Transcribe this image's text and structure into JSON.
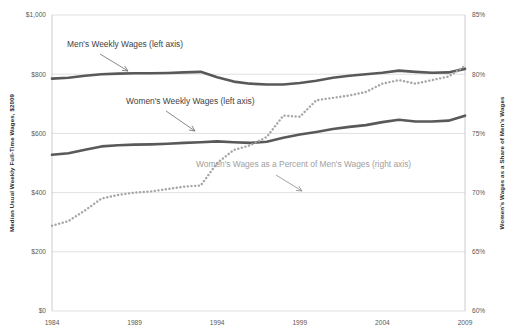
{
  "chart_data": {
    "type": "line",
    "title": "",
    "xlabel": "",
    "ylabel": "Median Usual Weekly Full-Time Wages, $2009",
    "y2label": "Women's Wages as a Share of Men's Wages",
    "x": [
      1984,
      1985,
      1986,
      1987,
      1988,
      1989,
      1990,
      1991,
      1992,
      1993,
      1994,
      1995,
      1996,
      1997,
      1998,
      1999,
      2000,
      2001,
      2002,
      2003,
      2004,
      2005,
      2006,
      2007,
      2008,
      2009
    ],
    "xlim": [
      1984,
      2009
    ],
    "xticks": [
      1984,
      1989,
      1994,
      1999,
      2004,
      2009
    ],
    "xticklabels": [
      "1984",
      "1989",
      "1994",
      "1999",
      "2004",
      "2009"
    ],
    "ylim": [
      0,
      1000
    ],
    "yticks": [
      0,
      200,
      400,
      600,
      800,
      1000
    ],
    "yticklabels": [
      "$0",
      "$200",
      "$400",
      "$600",
      "$800",
      "$1,000"
    ],
    "y2lim": [
      85,
      60
    ],
    "y2ticks": [
      60,
      65,
      70,
      75,
      80,
      85
    ],
    "y2ticklabels": [
      "60%",
      "65%",
      "70%",
      "75%",
      "80%",
      "85%"
    ],
    "y2_inverted": true,
    "grid": true,
    "legend_position": "annotations",
    "series": [
      {
        "name": "Men's Weekly Wages (left axis)",
        "axis": "left",
        "style": "solid",
        "color": "#595959",
        "values": [
          785,
          788,
          795,
          800,
          802,
          803,
          803,
          804,
          806,
          808,
          790,
          775,
          768,
          765,
          765,
          770,
          778,
          788,
          795,
          800,
          805,
          812,
          808,
          805,
          806,
          818
        ]
      },
      {
        "name": "Women's Weekly Wages (left axis)",
        "axis": "left",
        "style": "solid",
        "color": "#595959",
        "values": [
          528,
          533,
          545,
          556,
          560,
          562,
          563,
          565,
          568,
          570,
          573,
          570,
          568,
          572,
          585,
          596,
          605,
          615,
          622,
          628,
          638,
          646,
          640,
          640,
          643,
          660
        ]
      },
      {
        "name": "Women's Wages as a Percent of Men's Wages (right axis)",
        "axis": "right",
        "style": "dotted",
        "color": "#a6a6a6",
        "values": [
          67.2,
          67.6,
          68.5,
          69.5,
          69.8,
          70.0,
          70.1,
          70.3,
          70.5,
          70.6,
          72.5,
          73.6,
          74.0,
          74.7,
          76.5,
          76.4,
          77.8,
          78.0,
          78.2,
          78.5,
          79.2,
          79.5,
          79.2,
          79.5,
          79.8,
          80.7
        ]
      }
    ],
    "annotations": [
      {
        "text": "Men's Weekly Wages (left axis)",
        "color": "#3f3f3f",
        "text_x": 67,
        "text_y": 47,
        "arrow_from_x": 100,
        "arrow_from_y": 54,
        "arrow_to_x": 128,
        "arrow_to_y": 71
      },
      {
        "text": "Women's Weekly Wages (left axis)",
        "color": "#3f3f3f",
        "text_x": 126,
        "text_y": 104,
        "arrow_from_x": 166,
        "arrow_from_y": 111,
        "arrow_to_x": 195,
        "arrow_to_y": 131
      },
      {
        "text": "Women's Wages as a Percent of Men's Wages (right axis)",
        "color": "#a0a0a0",
        "text_x": 196,
        "text_y": 167,
        "arrow_from_x": 276,
        "arrow_from_y": 175,
        "arrow_to_x": 302,
        "arrow_to_y": 191
      }
    ]
  },
  "layout": {
    "plot_left": 52,
    "plot_right": 465,
    "plot_top": 15,
    "plot_bottom": 311
  }
}
